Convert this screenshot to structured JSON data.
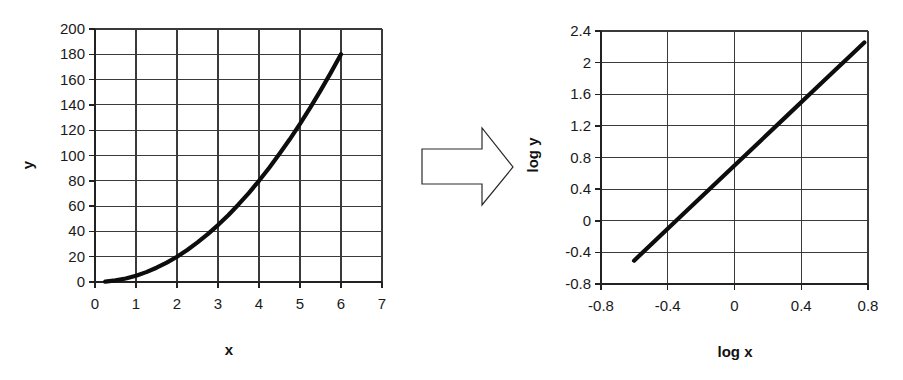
{
  "figure": {
    "background_color": "#ffffff",
    "line_color": "#0d0d0d",
    "grid_color": "#3a3a3a",
    "axis_color": "#222222"
  },
  "arrow": {
    "name": "transformation-arrow",
    "direction": "right",
    "fill": "#ffffff",
    "stroke": "#2b2b2b"
  },
  "chart_data": [
    {
      "id": "linear-plot",
      "type": "line",
      "title": "",
      "xlabel": "x",
      "ylabel": "y",
      "xlim": [
        0,
        7
      ],
      "ylim": [
        0,
        200
      ],
      "xticks": [
        "0",
        "1",
        "2",
        "3",
        "4",
        "5",
        "6",
        "7"
      ],
      "xtick_values": [
        0,
        1,
        2,
        3,
        4,
        5,
        6,
        7
      ],
      "yticks": [
        "0",
        "20",
        "40",
        "60",
        "80",
        "100",
        "120",
        "140",
        "160",
        "180",
        "200"
      ],
      "ytick_values": [
        0,
        20,
        40,
        60,
        80,
        100,
        120,
        140,
        160,
        180,
        200
      ],
      "grid": true,
      "legend": "none",
      "relation": "y = 5x^2",
      "x": [
        0.25,
        0.5,
        0.75,
        1.0,
        1.25,
        1.5,
        1.75,
        2.0,
        2.25,
        2.5,
        2.75,
        3.0,
        3.25,
        3.5,
        3.75,
        4.0,
        4.25,
        4.5,
        4.75,
        5.0,
        5.25,
        5.5,
        5.75,
        6.0
      ],
      "y": [
        0.3,
        1.3,
        2.8,
        5.0,
        7.8,
        11.3,
        15.3,
        20.0,
        25.3,
        31.3,
        37.8,
        45.0,
        52.8,
        61.3,
        70.3,
        80.0,
        90.3,
        101.3,
        112.8,
        125.0,
        137.8,
        151.3,
        165.3,
        180.0
      ]
    },
    {
      "id": "log-log-plot",
      "type": "line",
      "title": "",
      "xlabel": "log x",
      "ylabel": "log y",
      "xlim": [
        -0.8,
        0.8
      ],
      "ylim": [
        -0.8,
        2.4
      ],
      "xticks": [
        "-0.8",
        "-0.4",
        "0",
        "0.4",
        "0.8"
      ],
      "xtick_values": [
        -0.8,
        -0.4,
        0,
        0.4,
        0.8
      ],
      "yticks": [
        "-0.8",
        "-0.4",
        "0",
        "0.4",
        "0.8",
        "1.2",
        "1.6",
        "2",
        "2.4"
      ],
      "ytick_values": [
        -0.8,
        -0.4,
        0,
        0.4,
        0.8,
        1.2,
        1.6,
        2,
        2.4
      ],
      "grid": true,
      "legend": "none",
      "relation": "log y = 2 log x + log 5",
      "x": [
        -0.602,
        -0.301,
        0.0,
        0.301,
        0.477,
        0.602,
        0.699,
        0.778
      ],
      "y": [
        -0.505,
        0.097,
        0.699,
        1.301,
        1.653,
        1.903,
        2.097,
        2.255
      ]
    }
  ]
}
